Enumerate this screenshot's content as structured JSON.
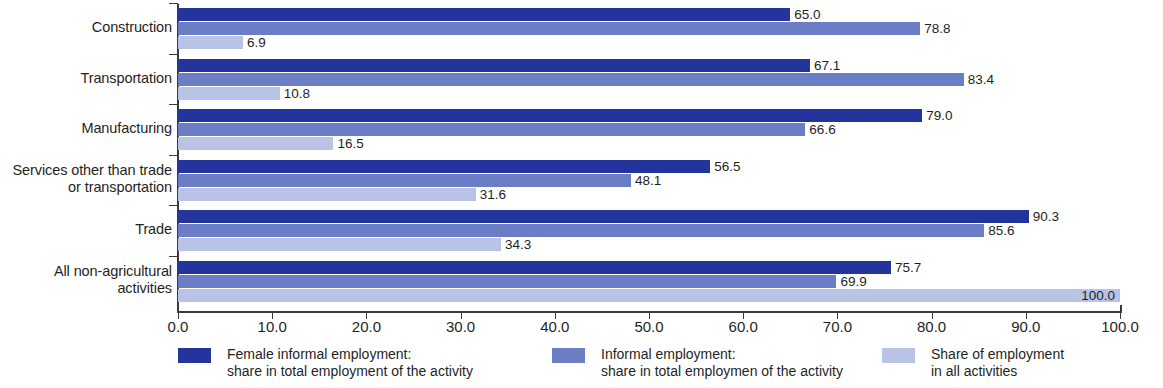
{
  "chart_data": {
    "type": "bar",
    "orientation": "horizontal",
    "title": "",
    "xlabel": "",
    "ylabel": "",
    "xlim": [
      0,
      100
    ],
    "grid": false,
    "legend_position": "bottom",
    "categories": [
      "Construction",
      "Transportation",
      "Manufacturing",
      "Services other than trade or transportation",
      "Trade",
      "All non-agricultural activities"
    ],
    "category_lines": [
      [
        "Construction"
      ],
      [
        "Transportation"
      ],
      [
        "Manufacturing"
      ],
      [
        "Services other than trade",
        "or transportation"
      ],
      [
        "Trade"
      ],
      [
        "All non-agricultural",
        "activities"
      ]
    ],
    "series": [
      {
        "name": "Female informal employment: share in total employment of the activity",
        "color": "#23349c",
        "values": [
          65.0,
          67.1,
          79.0,
          56.5,
          90.3,
          75.7
        ],
        "labels": [
          "65.0",
          "67.1",
          "79.0",
          "56.5",
          "90.3",
          "75.7"
        ]
      },
      {
        "name": "Informal employment: share in total employmen of the activity",
        "color": "#6b7dc4",
        "values": [
          78.8,
          83.4,
          66.6,
          48.1,
          85.6,
          69.9
        ],
        "labels": [
          "78.8",
          "83.4",
          "66.6",
          "48.1",
          "85.6",
          "69.9"
        ]
      },
      {
        "name": "Share of employment in all activities",
        "color": "#b9c3e6",
        "values": [
          6.9,
          10.8,
          16.5,
          31.6,
          34.3,
          100.0
        ],
        "labels": [
          "6.9",
          "10.8",
          "16.5",
          "31.6",
          "34.3",
          "100.0"
        ]
      }
    ],
    "xticks": [
      0.0,
      10.0,
      20.0,
      30.0,
      40.0,
      50.0,
      60.0,
      70.0,
      80.0,
      90.0,
      100.0
    ],
    "xtick_labels": [
      "0.0",
      "10.0",
      "20.0",
      "30.0",
      "40.0",
      "50.0",
      "60.0",
      "70.0",
      "80.0",
      "90.0",
      "100.0"
    ]
  },
  "legend": {
    "items": [
      {
        "swatch_color": "#23349c",
        "line1": "Female informal employment:",
        "line2": "share in total employment of the activity"
      },
      {
        "swatch_color": "#6b7dc4",
        "line1": "Informal employment:",
        "line2": "share in total employmen of the activity"
      },
      {
        "swatch_color": "#b9c3e6",
        "line1": "Share of employment",
        "line2": "in all activities"
      }
    ]
  },
  "colors": {
    "axis": "#3a3a3a",
    "text": "#1f1f1f",
    "background": "#ffffff",
    "series_1": "#23349c",
    "series_2": "#6b7dc4",
    "series_3": "#b9c3e6"
  }
}
